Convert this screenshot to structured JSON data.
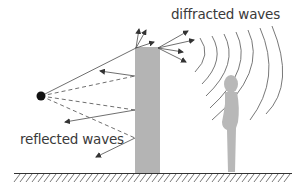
{
  "diagram": {
    "type": "wave-propagation-illustration",
    "labels": {
      "diffracted": "diffracted waves",
      "reflected": "reflected waves"
    },
    "elements": {
      "source": "point-source",
      "obstacle": "wall",
      "receiver": "person-silhouette",
      "ground": "hatched-ground"
    },
    "colors": {
      "wall": "#b4b4b4",
      "person": "#b8b8b8",
      "lines": "#4a4a4a",
      "source": "#111111",
      "text": "#3a3a3a"
    }
  }
}
